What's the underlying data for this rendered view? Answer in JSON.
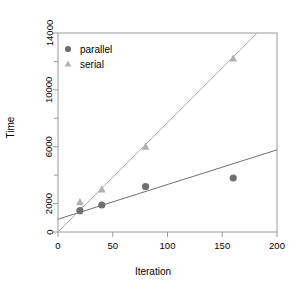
{
  "chart_data": {
    "type": "scatter",
    "title": "",
    "xlabel": "Iteration",
    "ylabel": "Time",
    "xlim": [
      0,
      200
    ],
    "ylim": [
      0,
      14000
    ],
    "xticks": [
      0,
      50,
      100,
      150,
      200
    ],
    "xtick_labels": [
      "0",
      "50",
      "100",
      "150",
      "200"
    ],
    "yticks": [
      0,
      2000,
      6000,
      10000,
      14000
    ],
    "ytick_labels": [
      "0",
      "2000",
      "6000",
      "10000",
      "14000"
    ],
    "yticks_minor": [
      4000,
      8000,
      12000
    ],
    "grid": false,
    "legend_position": "top-left",
    "series": [
      {
        "name": "parallel",
        "marker": "circle",
        "color": "#707070",
        "x": [
          20,
          40,
          80,
          160
        ],
        "y": [
          1500,
          1900,
          3200,
          3800
        ],
        "fit_line": {
          "intercept": 900,
          "slope": 24.4
        }
      },
      {
        "name": "serial",
        "marker": "triangle",
        "color": "#b0b0b0",
        "x": [
          20,
          40,
          80,
          160
        ],
        "y": [
          2100,
          3000,
          6000,
          12200
        ],
        "fit_line": {
          "intercept": 0,
          "slope": 77.0
        }
      }
    ]
  },
  "axes": {
    "frame_color": "#9a9a9a",
    "tick_color": "#9a9a9a"
  },
  "legend": {
    "entries": [
      {
        "label": "parallel",
        "marker": "circle",
        "color": "#707070"
      },
      {
        "label": "serial",
        "marker": "triangle",
        "color": "#b0b0b0"
      }
    ]
  }
}
